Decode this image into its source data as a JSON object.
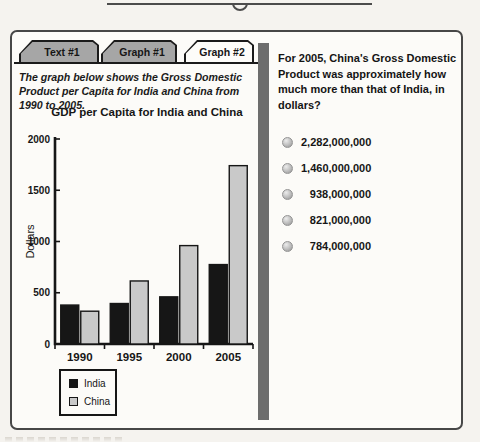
{
  "tabs": [
    {
      "label": "Text #1",
      "active": false
    },
    {
      "label": "Graph #1",
      "active": false
    },
    {
      "label": "Graph #2",
      "active": true
    }
  ],
  "description": "The graph below shows the Gross Domestic Product per Capita for India and China from 1990 to 2005.",
  "chart_data": {
    "type": "bar",
    "title": "GDP per Capita for India and China",
    "xlabel": "",
    "ylabel": "Dollars",
    "categories": [
      "1990",
      "1995",
      "2000",
      "2005"
    ],
    "series": [
      {
        "name": "India",
        "color": "#161616",
        "values": [
          380,
          395,
          460,
          775
        ]
      },
      {
        "name": "China",
        "color": "#c9c9c9",
        "values": [
          320,
          615,
          960,
          1740
        ]
      }
    ],
    "ylim": [
      0,
      2000
    ],
    "yticks": [
      0,
      500,
      1000,
      1500,
      2000
    ],
    "grid": false,
    "legend_position": "below-left"
  },
  "question": {
    "text": "For 2005, China's Gross Domestic Product was approximately how much more than that of India, in dollars?",
    "options": [
      "2,282,000,000",
      "1,460,000,000",
      "938,000,000",
      "821,000,000",
      "784,000,000"
    ]
  },
  "colors": {
    "axis": "#161616",
    "tab_inactive": "#a6a6a6",
    "tab_active": "#fdfcf9",
    "divider": "#6d6d6d",
    "panel_border": "#474747"
  }
}
